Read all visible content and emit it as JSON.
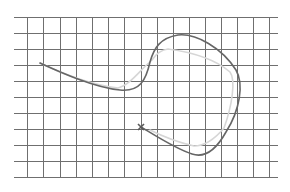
{
  "canvas": {
    "width": 290,
    "height": 192,
    "background": "#ffffff"
  },
  "grid": {
    "color": "#6f6f6f",
    "x_start": 14,
    "x_end": 278,
    "y_start": 17,
    "y_end": 178,
    "vertical_lines_x": [
      27,
      43,
      60,
      76,
      92,
      108,
      124,
      141,
      157,
      173,
      189,
      205,
      221,
      237,
      253,
      269
    ],
    "horizontal_lines_y": [
      17,
      33,
      49,
      65,
      81,
      97,
      113,
      129,
      145,
      161,
      177
    ]
  },
  "paths": {
    "main": {
      "color": "#666666",
      "d": "M40,63 C60,72 95,88 120,90 C140,92 146,80 150,62 C154,48 160,38 178,35 C196,33 222,48 236,70 C244,84 240,110 226,132 C216,150 204,158 192,154 C176,149 156,136 141,127"
    },
    "ghost": {
      "color": "#d6d6d6",
      "d": "M40,63 C62,74 95,86 118,88 C130,85 140,70 152,60 C156,54 160,50 168,49 C190,52 214,58 230,72 C236,80 232,106 224,128 C214,140 204,146 194,146 C176,142 162,136 150,130"
    }
  },
  "markers": [
    {
      "type": "cross",
      "x": 141,
      "y": 127,
      "size": 3,
      "color": "#5a5a5a"
    }
  ]
}
